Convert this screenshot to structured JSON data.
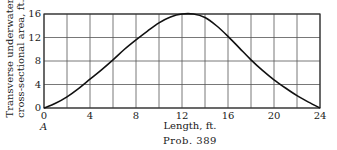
{
  "chart_data": {
    "type": "line",
    "title": "",
    "xlabel": "Length, ft.",
    "ylabel": [
      "Transverse underwater",
      "cross-sectional area, ft.²"
    ],
    "x_ticks": [
      0,
      4,
      8,
      12,
      16,
      20,
      24
    ],
    "y_ticks": [
      0,
      4,
      8,
      12,
      16
    ],
    "xlim": [
      0,
      24
    ],
    "ylim": [
      0,
      16
    ],
    "grid": true,
    "x_grid_step": 2,
    "y_grid_step": 4,
    "annotations": [
      {
        "text": "A",
        "x": 0,
        "y": 0,
        "position": "below origin"
      }
    ],
    "caption": "Prob. 389",
    "series": [
      {
        "name": "cross-sectional area",
        "x": [
          0,
          1,
          2,
          3,
          4,
          5,
          6,
          7,
          8,
          9,
          10,
          11,
          12,
          13,
          14,
          15,
          16,
          17,
          18,
          19,
          20,
          21,
          22,
          23,
          24
        ],
        "y": [
          0,
          0.8,
          1.9,
          3.3,
          4.9,
          6.5,
          8.2,
          10.0,
          11.6,
          13.1,
          14.5,
          15.5,
          16.0,
          16.0,
          15.4,
          14.0,
          12.2,
          10.2,
          8.2,
          6.4,
          4.8,
          3.4,
          2.1,
          1.0,
          0
        ]
      }
    ]
  },
  "labels": {
    "ylabel_line1": "Transverse underwater",
    "ylabel_line2": "cross-sectional area, ft.²",
    "xlabel": "Length, ft.",
    "caption": "Prob. 389",
    "point_a": "A",
    "x_ticks": [
      "0",
      "4",
      "8",
      "12",
      "16",
      "20",
      "24"
    ],
    "y_ticks": [
      "0",
      "4",
      "8",
      "12",
      "16"
    ]
  }
}
